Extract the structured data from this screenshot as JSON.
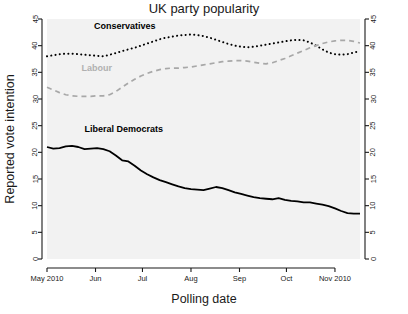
{
  "chart_data": {
    "type": "line",
    "title": "UK party popularity",
    "xlabel": "Polling date",
    "ylabel": "Reported vote intention",
    "ylim": [
      0,
      45
    ],
    "yticks": [
      0,
      5,
      10,
      15,
      20,
      25,
      30,
      35,
      40,
      45
    ],
    "ytick_labels": [
      "0",
      "5",
      "10",
      "15",
      "20",
      "25",
      "30",
      "35",
      "40",
      "45"
    ],
    "right_axis": true,
    "right_ytick_labels": [
      "0",
      "5",
      "10",
      "15",
      "20",
      "25",
      "30",
      "35",
      "40",
      "45"
    ],
    "grid": false,
    "legend_position": "inline-annotations",
    "xtick_labels": [
      "May 2010",
      "Jun",
      "Jul",
      "Aug",
      "Sep",
      "Oct",
      "Nov 2010"
    ],
    "xtick_positions": [
      0,
      31,
      61,
      92,
      123,
      153,
      184
    ],
    "x_range": [
      0,
      200
    ],
    "x_unit": "days since 1 May 2010",
    "series": [
      {
        "name": "Conservatives",
        "style": "dotted",
        "color": "#000000",
        "label_x": 30,
        "label_y": 43.2,
        "x": [
          0,
          4,
          8,
          12,
          16,
          20,
          24,
          28,
          32,
          36,
          40,
          44,
          48,
          52,
          56,
          60,
          64,
          68,
          72,
          76,
          80,
          84,
          88,
          92,
          96,
          100,
          104,
          108,
          112,
          116,
          120,
          124,
          128,
          132,
          136,
          140,
          144,
          148,
          152,
          156,
          160,
          164,
          168,
          172,
          176,
          180,
          184,
          188,
          192,
          196,
          200
        ],
        "values": [
          38.0,
          38.2,
          38.4,
          38.5,
          38.5,
          38.4,
          38.3,
          38.2,
          38.1,
          38.0,
          38.3,
          38.6,
          39.0,
          39.3,
          39.6,
          40.0,
          40.4,
          40.8,
          41.2,
          41.5,
          41.7,
          41.9,
          42.0,
          42.1,
          42.0,
          41.8,
          41.5,
          41.1,
          40.7,
          40.3,
          40.0,
          39.8,
          39.7,
          39.8,
          40.0,
          40.2,
          40.4,
          40.6,
          40.8,
          41.0,
          41.1,
          41.0,
          40.6,
          40.0,
          39.3,
          38.7,
          38.4,
          38.3,
          38.4,
          38.7,
          39.0
        ]
      },
      {
        "name": "Labour",
        "style": "dashed",
        "color": "#a8a8a8",
        "label_x": 22,
        "label_y": 35.2,
        "x": [
          0,
          4,
          8,
          12,
          16,
          20,
          24,
          28,
          32,
          36,
          40,
          44,
          48,
          52,
          56,
          60,
          64,
          68,
          72,
          76,
          80,
          84,
          88,
          92,
          96,
          100,
          104,
          108,
          112,
          116,
          120,
          124,
          128,
          132,
          136,
          140,
          144,
          148,
          152,
          156,
          160,
          164,
          168,
          172,
          176,
          180,
          184,
          188,
          192,
          196,
          200
        ],
        "values": [
          32.2,
          31.7,
          31.2,
          30.8,
          30.6,
          30.5,
          30.5,
          30.5,
          30.6,
          30.6,
          30.8,
          31.4,
          32.2,
          33.0,
          33.7,
          34.3,
          34.8,
          35.2,
          35.5,
          35.7,
          35.8,
          35.8,
          35.9,
          36.0,
          36.2,
          36.4,
          36.6,
          36.8,
          37.0,
          37.1,
          37.2,
          37.2,
          37.1,
          36.9,
          36.7,
          36.6,
          36.8,
          37.2,
          37.6,
          38.1,
          38.6,
          39.1,
          39.6,
          40.0,
          40.4,
          40.7,
          40.9,
          41.0,
          41.0,
          40.8,
          40.5
        ]
      },
      {
        "name": "Liberal Democrats",
        "style": "solid",
        "color": "#000000",
        "label_x": 24,
        "label_y": 23.8,
        "x": [
          0,
          4,
          8,
          12,
          16,
          20,
          24,
          28,
          32,
          36,
          40,
          44,
          48,
          52,
          56,
          60,
          64,
          68,
          72,
          76,
          80,
          84,
          88,
          92,
          96,
          100,
          104,
          108,
          112,
          116,
          120,
          124,
          128,
          132,
          136,
          140,
          144,
          148,
          152,
          156,
          160,
          164,
          168,
          172,
          176,
          180,
          184,
          188,
          192,
          196,
          200
        ],
        "values": [
          21.0,
          20.7,
          20.8,
          21.1,
          21.2,
          21.0,
          20.6,
          20.7,
          20.8,
          20.6,
          20.2,
          19.4,
          18.5,
          18.3,
          17.5,
          16.6,
          15.9,
          15.3,
          14.8,
          14.4,
          14.0,
          13.6,
          13.3,
          13.1,
          13.0,
          12.9,
          13.2,
          13.5,
          13.3,
          12.9,
          12.5,
          12.2,
          11.9,
          11.6,
          11.4,
          11.3,
          11.2,
          11.4,
          11.1,
          10.9,
          10.8,
          10.6,
          10.6,
          10.4,
          10.2,
          9.9,
          9.5,
          9.0,
          8.6,
          8.5,
          8.5
        ]
      }
    ]
  }
}
